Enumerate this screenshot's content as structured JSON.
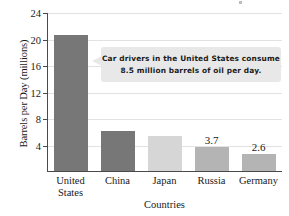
{
  "chart_data": {
    "type": "bar",
    "title": "",
    "xlabel": "Countries",
    "ylabel": "Barrels per Day (millions)",
    "categories": [
      "United States",
      "China",
      "Japan",
      "Russia",
      "Germany"
    ],
    "category_lines": [
      [
        "United",
        "States"
      ],
      [
        "China"
      ],
      [
        "Japan"
      ],
      [
        "Russia"
      ],
      [
        "Germany"
      ]
    ],
    "values": [
      20.6,
      6.1,
      5.3,
      3.7,
      2.6
    ],
    "value_labels": [
      "",
      "",
      "",
      "3.7",
      "2.6"
    ],
    "bar_colors": [
      "#777777",
      "#777777",
      "#d6d6d6",
      "#b4b4b4",
      "#b4b4b4"
    ],
    "ylim": [
      0,
      24
    ],
    "yticks": [
      4,
      8,
      12,
      16,
      20,
      24
    ],
    "ytick_labels": [
      "4",
      "8",
      "12",
      "16",
      "20",
      "24"
    ],
    "grid": true,
    "legend": "none"
  },
  "annotation": {
    "line1": "Car drivers in the United States consume",
    "line2": "8.5 million barrels of oil per day.",
    "background_color": "#e8e8e8"
  },
  "axes": {
    "axis_color": "#4a4a4a",
    "grid_color": "#e2e2e2"
  }
}
